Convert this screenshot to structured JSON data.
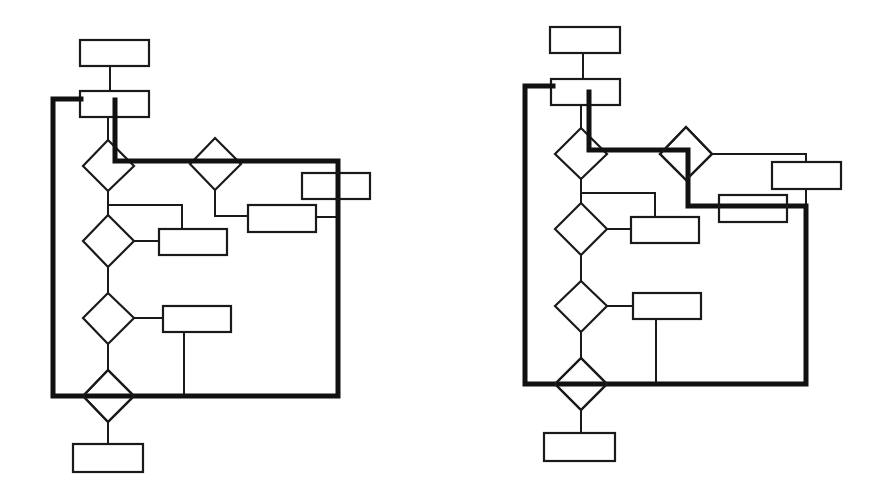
{
  "figure": {
    "colors": {
      "line": "#1a1a1a",
      "highlight_path": "#111111",
      "background": "#ffffff"
    }
  },
  "diagrams": [
    {
      "id": "left",
      "nodes": {
        "process_boxes": 7,
        "decision_diamonds": 5
      },
      "highlight_path": "Loop from second box down through first decision, right along top edge, down right side, across bottom and back up left side into second box"
    },
    {
      "id": "right",
      "nodes": {
        "process_boxes": 7,
        "decision_diamonds": 5
      },
      "highlight_path": "Loop from second box through first decision, right to second decision, down and right across lower box, down right side, across bottom and back up left side"
    }
  ]
}
